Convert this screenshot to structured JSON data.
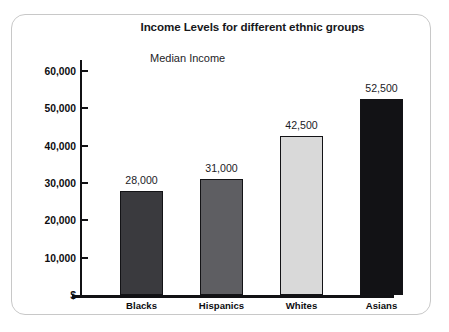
{
  "figure": {
    "title": "Income Levels for different ethnic groups",
    "subtitle": "Median Income",
    "frame_color": "#c8c8c8",
    "background": "#ffffff",
    "axis_color": "#111114"
  },
  "chart_data": {
    "type": "bar",
    "title": "Income Levels for different ethnic groups",
    "subtitle": "Median Income",
    "xlabel": "",
    "ylabel": "$",
    "categories": [
      "Blacks",
      "Hispanics",
      "Whites",
      "Asians"
    ],
    "values": [
      28000,
      31000,
      42500,
      52500
    ],
    "value_labels": [
      "28,000",
      "31,000",
      "42,500",
      "52,500"
    ],
    "bar_colors": [
      "#3a3a3e",
      "#5e5e62",
      "#d9d9d9",
      "#121215"
    ],
    "bar_border_color": "#131316",
    "ylim": [
      0,
      63000
    ],
    "yticks": [
      0,
      10000,
      20000,
      30000,
      40000,
      50000,
      60000
    ],
    "ytick_labels": [
      "$",
      "10,000",
      "20,000",
      "30,000",
      "40,000",
      "50,000",
      "60,000"
    ],
    "grid": false,
    "legend": false,
    "legend_position": "none"
  }
}
